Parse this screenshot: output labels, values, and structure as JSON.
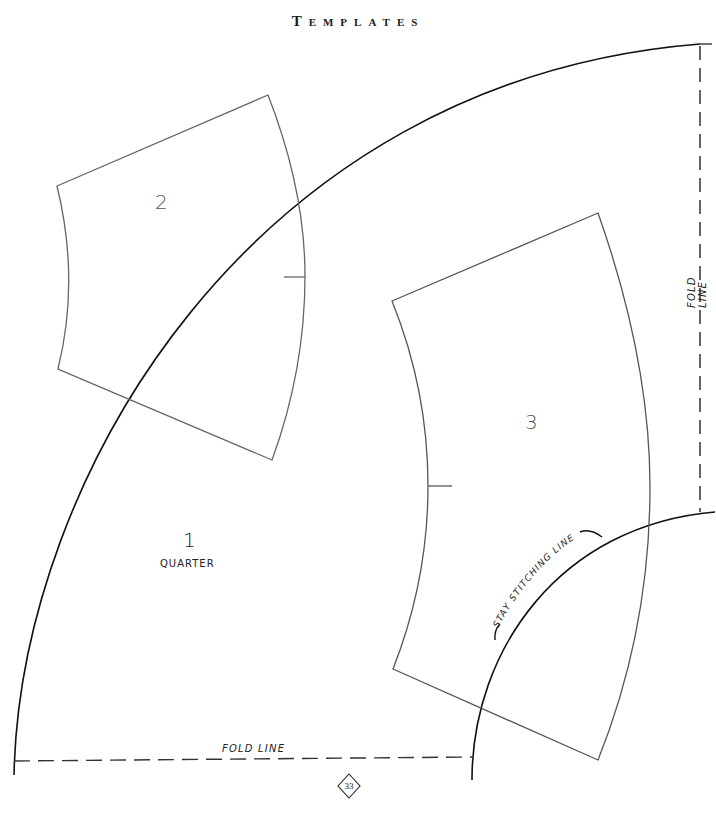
{
  "page": {
    "title": "Templates",
    "page_number": "33"
  },
  "templates": [
    {
      "id": "1",
      "number": "1",
      "caption": "QUARTER"
    },
    {
      "id": "2",
      "number": "2"
    },
    {
      "id": "3",
      "number": "3"
    }
  ],
  "annotations": {
    "fold_line_right": "FOLD LINE",
    "fold_line_bottom": "FOLD LINE",
    "stay_stitching": "STAY STITCHING LINE"
  },
  "colors": {
    "outline": "#1a1a1a",
    "template_outline": "#666666",
    "background": "#ffffff"
  }
}
